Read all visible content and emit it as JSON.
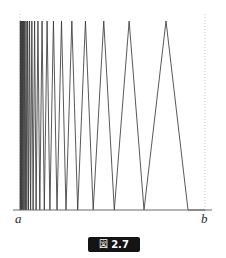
{
  "figure": {
    "caption_kanji": "図",
    "caption_number": "2.7",
    "caption_full": "図 2.7",
    "left_endpoint_label": "a",
    "right_endpoint_label": "b"
  },
  "style": {
    "curve_color": "#3a3a3a",
    "axis_color": "#6b6b6b",
    "guide_color": "#b9b9b9",
    "caption_bg": "#141414",
    "caption_fg": "#ffffff",
    "background": "#ffffff"
  },
  "chart_data": {
    "type": "line",
    "title": "図 2.7",
    "subtitle": "",
    "xlabel": "",
    "ylabel": "",
    "grid": false,
    "legend_position": "none",
    "xlim": [
      20,
      205
    ],
    "ylim": [
      0,
      1
    ],
    "x_tick_labels": [
      "a",
      "b"
    ],
    "x_tick_positions": [
      20,
      205
    ],
    "y_tick_labels": [],
    "axis_baseline_y": 210,
    "peak_top_y": 21,
    "guides": [
      {
        "name": "left-dotted-guide",
        "x": 20,
        "style": "dotted"
      },
      {
        "name": "right-dotted-guide",
        "x": 205,
        "style": "dotted"
      }
    ],
    "zero_crossings_x": [
      20.0,
      20.6,
      21.3,
      22.1,
      23.0,
      24.1,
      25.3,
      26.8,
      28.5,
      30.6,
      33.1,
      36.1,
      39.8,
      44.3,
      49.9,
      57.0,
      66.0,
      77.7,
      93.2,
      114.3,
      144.0,
      188.0,
      205.0
    ],
    "peaks_x": [
      20.3,
      20.95,
      21.7,
      22.55,
      23.55,
      24.7,
      26.05,
      27.65,
      29.55,
      31.85,
      34.6,
      37.95,
      42.05,
      47.1,
      53.45,
      61.5,
      71.85,
      85.45,
      103.75,
      129.15,
      166.0
    ],
    "peaks_y_value": 1.0,
    "n_visible_peaks": 21,
    "series": [
      {
        "name": "oscillating-zigzag",
        "values_note": "amplitude constant = 1.0 at every peak, 0.0 at every zero crossing"
      }
    ]
  }
}
